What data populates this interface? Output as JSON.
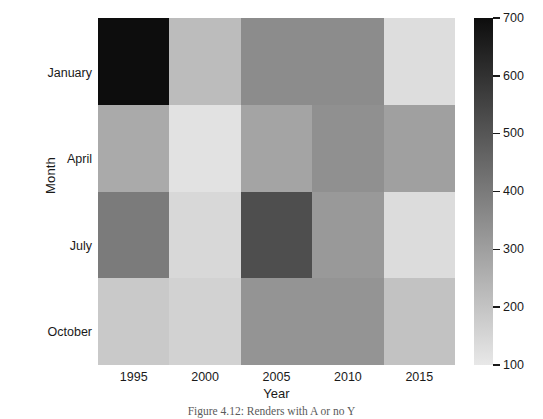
{
  "chart_data": {
    "type": "heatmap",
    "title": "",
    "xlabel": "Year",
    "ylabel": "Month",
    "x_categories": [
      "1995",
      "2000",
      "2005",
      "2010",
      "2015"
    ],
    "y_categories": [
      "January",
      "April",
      "July",
      "October"
    ],
    "grid": false,
    "legend_position": "right",
    "colorbar": {
      "label": "",
      "orientation": "vertical",
      "vmin": 100,
      "vmax": 700,
      "ticks": [
        700,
        600,
        500,
        400,
        300,
        200,
        100
      ],
      "tick_labels": [
        "700",
        "600",
        "500",
        "400",
        "300",
        "200",
        "100"
      ],
      "colormap": "greys-reversed",
      "low_color": "#e8e8e8",
      "high_color": "#0d0d0d"
    },
    "rows": [
      {
        "label": "January",
        "values": [
          700,
          210,
          370,
          370,
          130
        ],
        "colors": [
          "#0d0d0d",
          "#bcbcbc",
          "#8c8c8c",
          "#8c8c8c",
          "#dddddd"
        ]
      },
      {
        "label": "April",
        "values": [
          270,
          120,
          290,
          360,
          300
        ],
        "colors": [
          "#aaaaaa",
          "#e2e2e2",
          "#a4a4a4",
          "#909090",
          "#a0a0a0"
        ]
      },
      {
        "label": "July",
        "values": [
          430,
          150,
          530,
          330,
          140
        ],
        "colors": [
          "#7b7b7b",
          "#d8d8d8",
          "#4e4e4e",
          "#999999",
          "#dcdcdc"
        ]
      },
      {
        "label": "October",
        "values": [
          180,
          160,
          350,
          350,
          200
        ]
      }
    ],
    "matrix": [
      [
        700,
        210,
        370,
        370,
        130
      ],
      [
        270,
        120,
        290,
        360,
        300
      ],
      [
        430,
        150,
        530,
        330,
        140
      ],
      [
        180,
        160,
        350,
        350,
        200
      ]
    ],
    "cell_colors": [
      [
        "#0d0d0d",
        "#bcbcbc",
        "#8c8c8c",
        "#8c8c8c",
        "#dddddd"
      ],
      [
        "#aaaaaa",
        "#e2e2e2",
        "#a4a4a4",
        "#909090",
        "#a0a0a0"
      ],
      [
        "#7b7b7b",
        "#d8d8d8",
        "#4e4e4e",
        "#999999",
        "#dcdcdc"
      ],
      [
        "#c9c9c9",
        "#d2d2d2",
        "#949494",
        "#949494",
        "#c2c2c2"
      ]
    ]
  },
  "caption": {
    "text": "Figure 4.12: Renders with A or no Y"
  }
}
